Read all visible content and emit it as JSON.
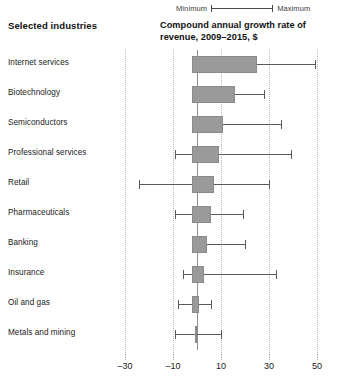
{
  "legend": {
    "min_label": "Minimum",
    "max_label": "Maximum",
    "range_bar_icon": "range-line-icon"
  },
  "headers": {
    "left": "Selected industries",
    "right": "Compound annual growth rate of revenue, 2009–2015, $"
  },
  "chart_data": {
    "type": "bar",
    "title": "Compound annual growth rate of revenue, 2009–2015, $",
    "xlabel": "",
    "ylabel": "Selected industries",
    "xlim": [
      -38,
      56
    ],
    "xticks": [
      -30,
      -10,
      10,
      30,
      50
    ],
    "xtick_labels": [
      "–30",
      "–10",
      "10",
      "30",
      "50"
    ],
    "grid": true,
    "legend_position": "top-right",
    "orientation": "horizontal",
    "zero_line": 0,
    "categories": [
      "Internet services",
      "Biotechnology",
      "Semiconductors",
      "Professional services",
      "Retail",
      "Pharmaceuticals",
      "Banking",
      "Insurance",
      "Oil and gas",
      "Metals and mining"
    ],
    "series": [
      {
        "name": "Interquartile range",
        "values": [
          {
            "low": -2,
            "high": 25
          },
          {
            "low": -2,
            "high": 16
          },
          {
            "low": -2,
            "high": 11
          },
          {
            "low": -2,
            "high": 9
          },
          {
            "low": -2,
            "high": 7
          },
          {
            "low": -2,
            "high": 6
          },
          {
            "low": -2,
            "high": 4
          },
          {
            "low": -2,
            "high": 3
          },
          {
            "low": -2,
            "high": 1
          },
          {
            "low": -1,
            "high": 0
          }
        ]
      },
      {
        "name": "Minimum to maximum",
        "values": [
          {
            "min": -2,
            "max": 49
          },
          {
            "min": -2,
            "max": 28
          },
          {
            "min": -2,
            "max": 35
          },
          {
            "min": -9,
            "max": 39
          },
          {
            "min": -24,
            "max": 30
          },
          {
            "min": -9,
            "max": 19
          },
          {
            "min": -2,
            "max": 20
          },
          {
            "min": -6,
            "max": 33
          },
          {
            "min": -8,
            "max": 6
          },
          {
            "min": -9,
            "max": 10
          }
        ]
      }
    ],
    "colors": {
      "bar_fill": "#9a9a9a",
      "bar_stroke": "#8a8a8a",
      "whisker": "#5a5a5a",
      "gridline": "#b9b9b9",
      "zero_line": "#8f8f8f",
      "text": "#1a1a1a"
    }
  }
}
